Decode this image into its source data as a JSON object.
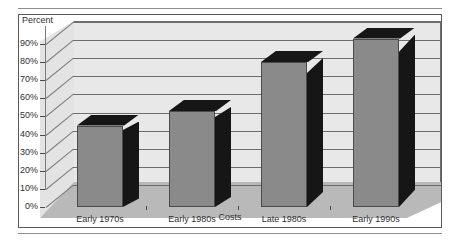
{
  "chart_data": {
    "type": "bar",
    "title": "",
    "subtitle": "",
    "xlabel": "Costs",
    "ylabel": "Percent",
    "categories": [
      "Early 1970s",
      "Early 1980s",
      "Late 1980s",
      "Early 1990s"
    ],
    "values": [
      45,
      53,
      80,
      93
    ],
    "ylim": [
      0,
      90
    ],
    "ytick_labels": [
      "90%",
      "80%",
      "70%",
      "60%",
      "50%",
      "40%",
      "30%",
      "20%",
      "10%",
      "0%"
    ],
    "ytick_values": [
      90,
      80,
      70,
      60,
      50,
      40,
      30,
      20,
      10,
      0
    ],
    "grid": true,
    "legend": null,
    "style": "3d-column",
    "series": [
      {
        "name": "Costs",
        "values": [
          45,
          53,
          80,
          93
        ]
      }
    ],
    "colors": {
      "bar_face": "#8a8a8a",
      "bar_shadow": "#161616",
      "back_wall": "#e8e8e8",
      "side_wall": "#e3e3e3",
      "floor": "#b9b9b9",
      "gridline": "#6d6d6d",
      "frame": "#5a5a5a",
      "text": "#2f2f2f"
    }
  },
  "figure": {
    "y_axis_title": "Percent",
    "x_axis_title": "Costs"
  }
}
